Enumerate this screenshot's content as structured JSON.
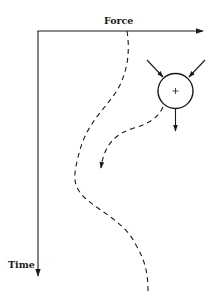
{
  "diagram": {
    "axes": {
      "x_label": "Force",
      "y_label": "Time"
    },
    "colors": {
      "stroke": "#1a1a1a",
      "background": "#ffffff"
    },
    "body": {
      "shape": "circle",
      "center_symbol": "+",
      "incoming_arrows": 2,
      "outgoing_arrows": 1
    },
    "paths": [
      {
        "name": "long-dashed-trajectory",
        "style": "dashed",
        "shape": "S-curve"
      },
      {
        "name": "short-dashed-trajectory",
        "style": "dashed",
        "arrowhead": true
      }
    ]
  }
}
